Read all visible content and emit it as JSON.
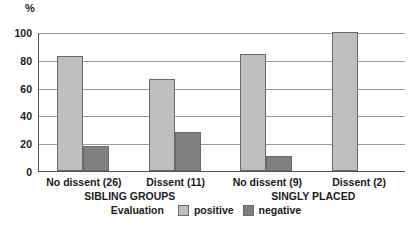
{
  "chart_data": {
    "type": "bar",
    "title": "",
    "unit_label": "%",
    "xlabel": "",
    "ylabel": "",
    "ylim": [
      0,
      100
    ],
    "yticks": [
      0,
      20,
      40,
      60,
      80,
      100
    ],
    "grid": true,
    "categories": [
      "No dissent (26)",
      "Dissent (11)",
      "No dissent (9)",
      "Dissent (2)"
    ],
    "group_labels": [
      {
        "label": "SIBLING GROUPS",
        "categories": [
          "No dissent (26)",
          "Dissent (11)"
        ]
      },
      {
        "label": "SINGLY PLACED",
        "categories": [
          "No dissent (9)",
          "Dissent (2)"
        ]
      }
    ],
    "series": [
      {
        "name": "positive",
        "color": "#bfbfbf",
        "values": [
          83,
          66,
          84,
          101
        ]
      },
      {
        "name": "negative",
        "color": "#808080",
        "values": [
          18,
          28,
          11,
          0
        ]
      }
    ],
    "legend": {
      "title": "Evaluation",
      "position": "bottom",
      "entries": [
        {
          "label": "positive",
          "color": "#bfbfbf"
        },
        {
          "label": "negative",
          "color": "#808080"
        }
      ]
    }
  },
  "colors": {
    "positive": "#bfbfbf",
    "negative": "#808080",
    "axis": "#555555",
    "grid": "#9a9a9a",
    "text": "#1a1a1a",
    "background": "#ffffff"
  }
}
